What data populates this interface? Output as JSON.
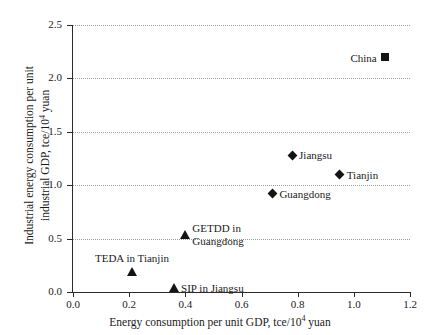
{
  "chart_data": {
    "type": "scatter",
    "title": "",
    "xlabel": "Energy consumption per unit GDP, tce/10⁴ yuan",
    "ylabel_line1": "Industrial energy consumption per unit",
    "ylabel_line2": "industrial GDP, tce/10⁴ yuan",
    "xlim": [
      0.0,
      1.2
    ],
    "ylim": [
      0.0,
      2.5
    ],
    "xticks": [
      "0.0",
      "0.2",
      "0.4",
      "0.6",
      "0.8",
      "1.0",
      "1.2"
    ],
    "xtick_values": [
      0.0,
      0.2,
      0.4,
      0.6,
      0.8,
      1.0,
      1.2
    ],
    "yticks": [
      "0.0",
      "0.5",
      "1.0",
      "1.5",
      "2.0",
      "2.5"
    ],
    "ytick_values": [
      0.0,
      0.5,
      1.0,
      1.5,
      2.0,
      2.5
    ],
    "grid": "horizontal-dotted",
    "legend": "none",
    "marker_color": "#141414",
    "points": [
      {
        "label": "China",
        "x": 1.11,
        "y": 2.2,
        "marker": "square",
        "label_side": "left"
      },
      {
        "label": "Jiangsu",
        "x": 0.78,
        "y": 1.28,
        "marker": "diamond",
        "label_side": "right"
      },
      {
        "label": "Tianjin",
        "x": 0.95,
        "y": 1.1,
        "marker": "diamond",
        "label_side": "right"
      },
      {
        "label": "Guangdong",
        "x": 0.71,
        "y": 0.92,
        "marker": "diamond",
        "label_side": "right"
      },
      {
        "label": "GETDD in Guangdong",
        "x": 0.4,
        "y": 0.54,
        "marker": "triangle",
        "label_side": "right-two-line"
      },
      {
        "label": "TEDA in Tianjin",
        "x": 0.21,
        "y": 0.19,
        "marker": "triangle",
        "label_side": "above"
      },
      {
        "label": "SIP in Jiangsu",
        "x": 0.36,
        "y": 0.04,
        "marker": "triangle",
        "label_side": "right"
      }
    ]
  }
}
